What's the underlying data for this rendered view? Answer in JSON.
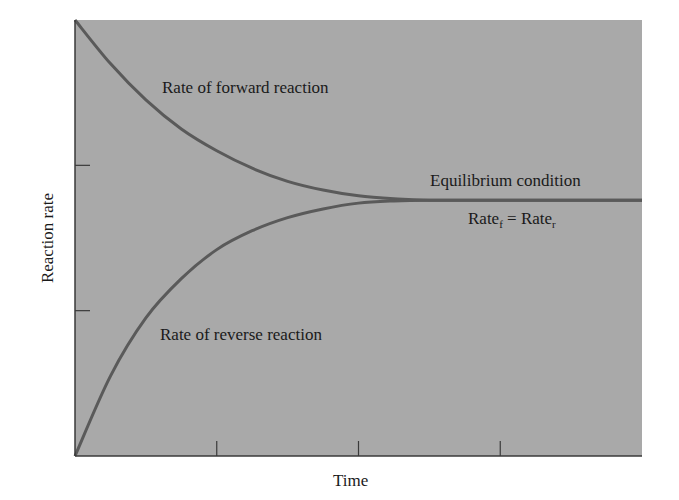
{
  "chart_data": {
    "type": "line",
    "title": "",
    "xlabel": "Time",
    "ylabel": "Reaction rate",
    "x_ticks": [
      1,
      2,
      3
    ],
    "y_ticks": [
      1,
      2
    ],
    "x_tick_labels": [],
    "y_tick_labels": [],
    "xlim": [
      0,
      4
    ],
    "ylim": [
      0,
      3
    ],
    "grid": false,
    "legend": "none",
    "series": [
      {
        "name": "Rate of forward reaction",
        "x": [
          0,
          0.25,
          0.5,
          0.75,
          1.0,
          1.25,
          1.5,
          1.75,
          2.0,
          2.25,
          2.5,
          3.0,
          3.5,
          4.0
        ],
        "values": [
          3.0,
          2.7,
          2.45,
          2.25,
          2.1,
          1.98,
          1.89,
          1.83,
          1.79,
          1.77,
          1.76,
          1.76,
          1.76,
          1.76
        ]
      },
      {
        "name": "Rate of reverse reaction",
        "x": [
          0,
          0.25,
          0.5,
          0.75,
          1.0,
          1.25,
          1.5,
          1.75,
          2.0,
          2.25,
          2.5,
          3.0,
          3.5,
          4.0
        ],
        "values": [
          0,
          0.55,
          0.95,
          1.22,
          1.42,
          1.55,
          1.64,
          1.7,
          1.74,
          1.755,
          1.76,
          1.76,
          1.76,
          1.76
        ]
      }
    ],
    "annotations": [
      "Rate of forward reaction",
      "Rate of reverse reaction",
      "Equilibrium condition",
      "Rate_f = Rate_r"
    ],
    "colors": {
      "plot_background": "#a9a9a9",
      "curve": "#5a5a5a",
      "axis": "#3a3a3a"
    }
  },
  "labels": {
    "forward": "Rate of forward reaction",
    "reverse": "Rate of reverse reaction",
    "equilibrium": "Equilibrium condition",
    "rate": "Rate",
    "sub_f": "f",
    "equals": " = ",
    "sub_r": "r",
    "xlabel": "Time",
    "ylabel": "Reaction rate"
  }
}
